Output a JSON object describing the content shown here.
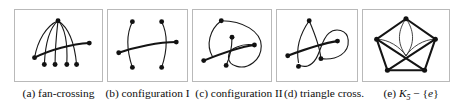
{
  "figure": {
    "kind": "graph-drawing-figure",
    "panel_count": 5,
    "background_color": "#ffffff",
    "frame_color": "#b9b9b9",
    "edge_color": "#1a1a1a",
    "node_color": "#111111"
  },
  "panels": [
    {
      "id": "a",
      "caption": "(a) fan-crossing",
      "description": "apex vertex with four curved edges to four bottom vertices, crossed by one long nearly-horizontal edge",
      "vertex_count": 7,
      "edge_count": 5
    },
    {
      "id": "b",
      "caption": "(b) configuration I",
      "description": "two vertical curved edges crossed by one horizontal curved edge",
      "vertex_count": 6,
      "edge_count": 3
    },
    {
      "id": "c",
      "caption": "(c) configuration II",
      "description": "teardrop self-returning curve from top vertex plus a vertical edge and a diagonal edge",
      "vertex_count": 5,
      "edge_count": 3
    },
    {
      "id": "d",
      "caption": "(d) triangle cross.",
      "description": "apex vertex with two descending edges, a right-hand loop and a diagonal crossing edge",
      "vertex_count": 5,
      "edge_count": 4
    },
    {
      "id": "e",
      "caption_prefix": "(e) ",
      "caption_math_base": "K",
      "caption_math_sub": "5",
      "caption_math_op": " − {",
      "caption_math_var": "e",
      "caption_math_close": "}",
      "caption": "(e) K5 − {e}",
      "description": "pentagon with curved diagonals, lens at top, crossings in the middle",
      "vertex_count": 5,
      "edge_count": 9
    }
  ]
}
